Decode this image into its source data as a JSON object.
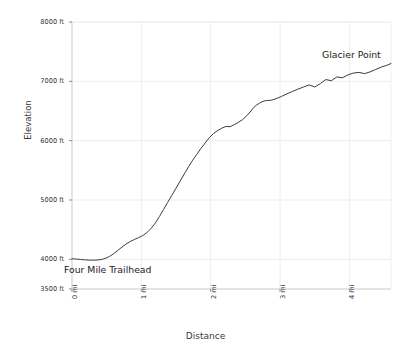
{
  "chart_data": {
    "type": "line",
    "title": "",
    "xlabel": "Distance",
    "ylabel": "Elevation",
    "xlim": [
      0,
      4.6
    ],
    "ylim": [
      3500,
      8000
    ],
    "grid": true,
    "legend": null,
    "line_color": "#3c3c3c",
    "x_tick_labels": [
      "0 mi",
      "1 mi",
      "2 mi",
      "3 mi",
      "4 mi"
    ],
    "x_tick_values": [
      0,
      1,
      2,
      3,
      4
    ],
    "y_tick_labels": [
      "3500 ft",
      "4000 ft",
      "5000 ft",
      "6000 ft",
      "7000 ft",
      "8000 ft"
    ],
    "y_tick_values": [
      3500,
      4000,
      5000,
      6000,
      7000,
      8000
    ],
    "annotations": [
      {
        "name": "start-label",
        "text": "Four Mile Trailhead",
        "x": 0.05,
        "y": 3790
      },
      {
        "name": "end-label",
        "text": "Glacier Point",
        "x": 4.05,
        "y": 7560
      }
    ],
    "x": [
      0.0,
      0.06,
      0.12,
      0.18,
      0.24,
      0.3,
      0.36,
      0.42,
      0.48,
      0.54,
      0.6,
      0.66,
      0.72,
      0.78,
      0.84,
      0.9,
      0.96,
      1.02,
      1.08,
      1.14,
      1.2,
      1.26,
      1.32,
      1.38,
      1.44,
      1.5,
      1.56,
      1.62,
      1.68,
      1.74,
      1.8,
      1.86,
      1.92,
      1.98,
      2.04,
      2.1,
      2.16,
      2.22,
      2.28,
      2.34,
      2.4,
      2.46,
      2.52,
      2.58,
      2.62,
      2.66,
      2.7,
      2.74,
      2.78,
      2.82,
      2.86,
      2.9,
      2.96,
      3.02,
      3.1,
      3.18,
      3.26,
      3.34,
      3.42,
      3.5,
      3.58,
      3.66,
      3.74,
      3.82,
      3.9,
      3.98,
      4.06,
      4.14,
      4.22,
      4.3,
      4.38,
      4.46,
      4.54,
      4.6
    ],
    "y": [
      4010,
      4005,
      3998,
      3992,
      3988,
      3986,
      3988,
      3996,
      4015,
      4048,
      4095,
      4150,
      4205,
      4258,
      4300,
      4335,
      4365,
      4400,
      4450,
      4520,
      4610,
      4720,
      4840,
      4960,
      5080,
      5200,
      5320,
      5440,
      5560,
      5670,
      5770,
      5870,
      5960,
      6050,
      6120,
      6170,
      6210,
      6240,
      6235,
      6270,
      6310,
      6355,
      6420,
      6500,
      6560,
      6600,
      6630,
      6655,
      6672,
      6678,
      6680,
      6690,
      6715,
      6745,
      6790,
      6830,
      6870,
      6905,
      6940,
      6905,
      6960,
      7030,
      7010,
      7075,
      7060,
      7110,
      7140,
      7150,
      7130,
      7160,
      7200,
      7240,
      7270,
      7300
    ]
  }
}
